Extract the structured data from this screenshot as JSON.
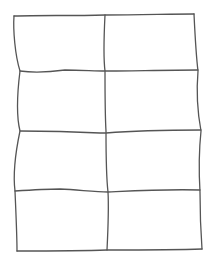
{
  "diagram": {
    "type": "hand-drawn-grid-wireframe",
    "rows": 4,
    "columns": 2,
    "cell_count": 8,
    "labels": [],
    "style": {
      "background": "#ffffff",
      "stroke_color": "#555555",
      "stroke_width": 1.3
    }
  }
}
